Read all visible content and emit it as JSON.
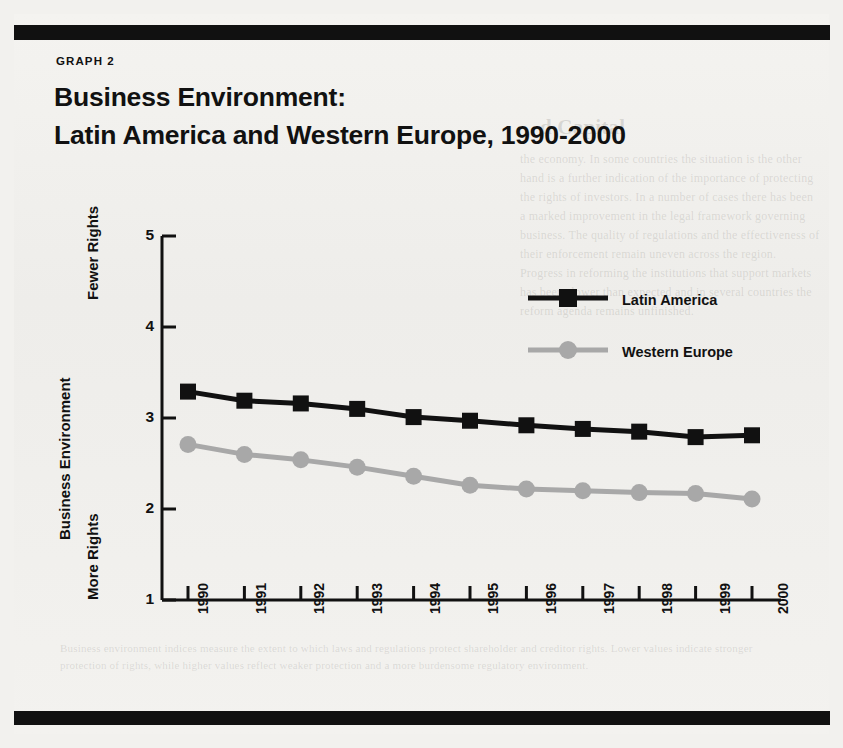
{
  "page": {
    "background_color": "#f2f1ee",
    "rule_color": "#111111"
  },
  "kicker": "GRAPH  2",
  "title_line1": "Business Environment:",
  "title_line2": "Latin America and Western Europe, 1990-2000",
  "axis": {
    "y_title": "Business Environment",
    "y_top_label": "Fewer Rights",
    "y_bottom_label": "More Rights",
    "y_ticks": [
      "5",
      "4",
      "3",
      "2",
      "1"
    ],
    "x_ticks": [
      "1990",
      "1991",
      "1992",
      "1993",
      "1994",
      "1995",
      "1996",
      "1997",
      "1998",
      "1999",
      "2000"
    ]
  },
  "legend": {
    "items": [
      {
        "label": "Latin America",
        "color": "#111111",
        "marker": "square"
      },
      {
        "label": "Western Europe",
        "color": "#a8a8a8",
        "marker": "circle"
      }
    ]
  },
  "ghost_text": {
    "heading": "d Capital",
    "right_block": "the economy. In some countries the situation is the other hand is a further indication of the importance of protecting the rights of investors. In a number of cases there has been a marked improvement in the legal framework governing business. The quality of regulations and the effectiveness of their enforcement remain uneven across the region. Progress in reforming the institutions that support markets has been slower than expected and in several countries the reform agenda remains unfinished.",
    "bottom_block": "Business environment indices measure the extent to which laws and regulations protect shareholder and creditor rights. Lower values indicate stronger protection of rights, while higher values reflect weaker protection and a more burdensome regulatory environment."
  },
  "chart_data": {
    "type": "line",
    "title": "Business Environment: Latin America and Western Europe, 1990-2000",
    "xlabel": "",
    "ylabel": "Business Environment",
    "ylim": [
      1,
      5
    ],
    "yticks": [
      1,
      2,
      3,
      4,
      5
    ],
    "y_axis_note_top": "Fewer Rights",
    "y_axis_note_bottom": "More Rights",
    "grid": false,
    "legend_position": "upper right",
    "categories": [
      "1990",
      "1991",
      "1992",
      "1993",
      "1994",
      "1995",
      "1996",
      "1997",
      "1998",
      "1999",
      "2000"
    ],
    "series": [
      {
        "name": "Latin America",
        "color": "#111111",
        "marker": "square",
        "values": [
          3.29,
          3.19,
          3.16,
          3.1,
          3.01,
          2.97,
          2.92,
          2.88,
          2.85,
          2.79,
          2.81
        ]
      },
      {
        "name": "Western Europe",
        "color": "#a8a8a8",
        "marker": "circle",
        "values": [
          2.71,
          2.6,
          2.54,
          2.46,
          2.36,
          2.26,
          2.22,
          2.2,
          2.18,
          2.17,
          2.11
        ]
      }
    ]
  }
}
